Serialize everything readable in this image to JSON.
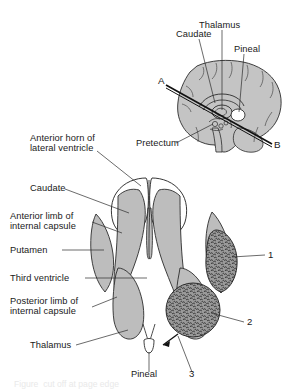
{
  "figure": {
    "kind": "anatomy-diagram",
    "title_visible": false,
    "background_color": "#ffffff",
    "stroke_color": "#2b2b2b",
    "gray_fill": "#bdbdbd",
    "brain_fill": "#c4c4c4",
    "stipple_fill": "#8a8a8a",
    "text_color": "#1a1a1a"
  },
  "sagittal": {
    "name": "midsagittal-brain-view",
    "labels": {
      "thalamus": "Thalamus",
      "caudate": "Caudate",
      "pineal": "Pineal",
      "pretectum": "Pretectum"
    },
    "section_line": {
      "start_label": "A",
      "end_label": "B"
    }
  },
  "axial": {
    "name": "axial-section-view",
    "labels": {
      "anterior_horn": "Anterior horn of\nlateral ventricle",
      "anterior_horn_l1": "Anterior horn of",
      "anterior_horn_l2": "lateral ventricle",
      "caudate": "Caudate",
      "anterior_limb_l1": "Anterior limb of",
      "anterior_limb_l2": "internal capsule",
      "putamen": "Putamen",
      "third_ventricle": "Third ventricle",
      "posterior_limb_l1": "Posterior limb of",
      "posterior_limb_l2": "internal capsule",
      "thalamus": "Thalamus",
      "pineal": "Pineal"
    },
    "numbered_markers": [
      {
        "id": "1",
        "label": "1",
        "shape": "elongated-oval",
        "texture": "stippled"
      },
      {
        "id": "2",
        "label": "2",
        "shape": "round",
        "texture": "stippled"
      },
      {
        "id": "3",
        "label": "3",
        "shape": "arrow-pointer",
        "texture": "none"
      }
    ]
  },
  "caption": {
    "text": "Figure  cut off at page edge"
  }
}
